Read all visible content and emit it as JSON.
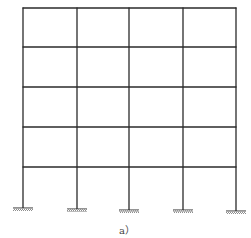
{
  "diagram": {
    "type": "multi-story plane frame",
    "caption": "a）",
    "stories": 4,
    "bays": 4,
    "line_color": "#2a2a2a",
    "support_color": "#555555",
    "columns_x": [
      23,
      77,
      129,
      183,
      236
    ],
    "beams_y": [
      8,
      47,
      87,
      127,
      167
    ],
    "supports": [
      {
        "x": 23,
        "y": 208,
        "type": "fixed"
      },
      {
        "x": 77,
        "y": 209,
        "type": "fixed"
      },
      {
        "x": 129,
        "y": 210,
        "type": "fixed"
      },
      {
        "x": 183,
        "y": 210,
        "type": "fixed"
      },
      {
        "x": 236,
        "y": 211,
        "type": "fixed"
      }
    ]
  }
}
